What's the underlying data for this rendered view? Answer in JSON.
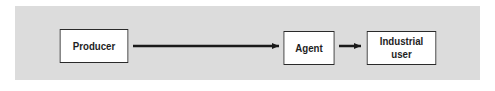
{
  "diagram": {
    "background_color": "#dcdcdc",
    "nodes": [
      {
        "id": "producer",
        "label": "Producer"
      },
      {
        "id": "agent",
        "label": "Agent"
      },
      {
        "id": "industrial_user",
        "label": "Industrial\nuser",
        "lines": [
          "Industrial",
          "user"
        ]
      }
    ],
    "edges": [
      {
        "from": "producer",
        "to": "agent"
      },
      {
        "from": "agent",
        "to": "industrial_user"
      }
    ]
  }
}
